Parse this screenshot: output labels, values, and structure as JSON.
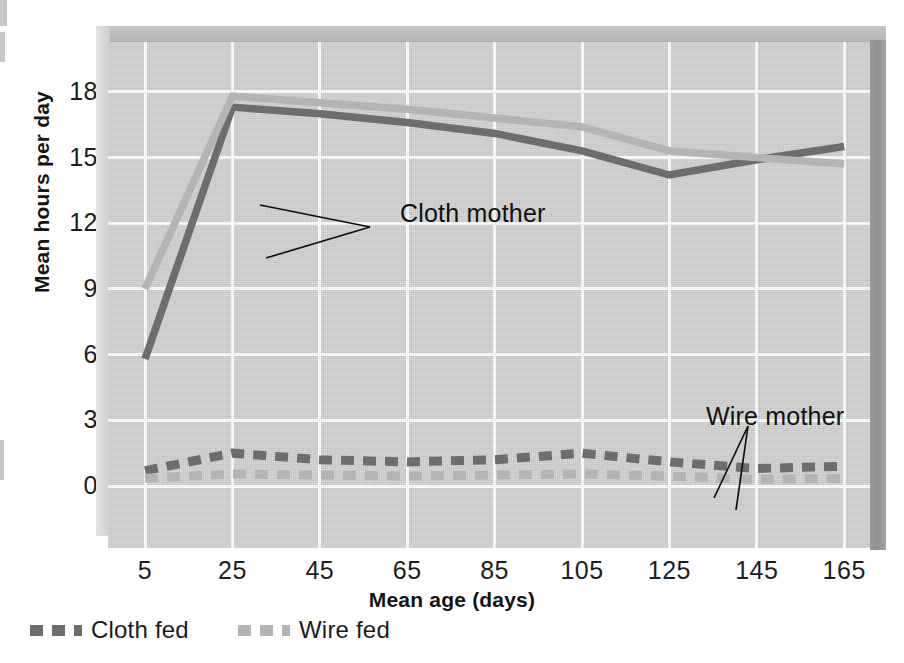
{
  "chart_data": {
    "type": "line",
    "title": "",
    "xlabel": "Mean age (days)",
    "ylabel": "Mean hours per day",
    "x": [
      5,
      25,
      45,
      65,
      85,
      105,
      125,
      145,
      165
    ],
    "xticks": [
      "5",
      "25",
      "45",
      "65",
      "85",
      "105",
      "125",
      "145",
      "165"
    ],
    "yticks": [
      "0",
      "3",
      "6",
      "9",
      "12",
      "15",
      "18"
    ],
    "xlim": [
      -5,
      175
    ],
    "ylim": [
      -2.2,
      20.8
    ],
    "grid": true,
    "legend_position": "below-axes-left",
    "series": [
      {
        "name": "Cloth fed",
        "group": "cloth-mother",
        "style": "solid",
        "color": "#6d6d6d",
        "values": [
          5.8,
          17.3,
          17.0,
          16.6,
          16.1,
          15.3,
          14.2,
          14.9,
          15.5
        ]
      },
      {
        "name": "Wire fed",
        "group": "cloth-mother",
        "style": "solid",
        "color": "#b4b4b4",
        "values": [
          9.0,
          17.8,
          17.5,
          17.2,
          16.8,
          16.4,
          15.3,
          15.0,
          14.7
        ]
      },
      {
        "name": "Cloth fed",
        "group": "wire-mother",
        "style": "dashed",
        "color": "#6d6d6d",
        "values": [
          0.7,
          1.5,
          1.2,
          1.1,
          1.2,
          1.5,
          1.1,
          0.8,
          0.9
        ]
      },
      {
        "name": "Wire fed",
        "group": "wire-mother",
        "style": "dashed",
        "color": "#b4b4b4",
        "values": [
          0.35,
          0.55,
          0.5,
          0.45,
          0.5,
          0.55,
          0.45,
          0.3,
          0.35
        ]
      }
    ],
    "annotations": [
      {
        "text": "Cloth mother",
        "points_to": [
          "cloth-fed-upper",
          "wire-fed-upper"
        ]
      },
      {
        "text": "Wire mother",
        "points_to": [
          "cloth-fed-lower",
          "wire-fed-lower"
        ]
      }
    ],
    "legend": [
      {
        "label": "Cloth fed",
        "color": "#6d6d6d",
        "style": "dashed"
      },
      {
        "label": "Wire fed",
        "color": "#b4b4b4",
        "style": "dashed"
      }
    ],
    "colors": {
      "plot_background": "#d2d2d2",
      "gridline": "#fdfdfd",
      "dark_series": "#6d6d6d",
      "light_series": "#b4b4b4",
      "text": "#1a1a1a"
    }
  }
}
